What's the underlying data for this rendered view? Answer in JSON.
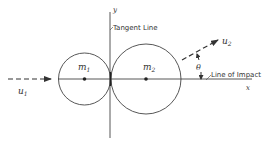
{
  "diagram": {
    "axes": {
      "x_label": "x",
      "y_label": "y"
    },
    "bodies": [
      {
        "label": "m",
        "subscript": "1",
        "name": "mass-1"
      },
      {
        "label": "m",
        "subscript": "2",
        "name": "mass-2"
      }
    ],
    "velocities": [
      {
        "label": "u",
        "subscript": "1",
        "name": "initial-velocity-1"
      },
      {
        "label": "u",
        "subscript": "2",
        "name": "velocity-2"
      }
    ],
    "angle_label": "θ",
    "annotations": {
      "tangent_line": "Tangent Line",
      "line_of_impact": "Line of Impact"
    },
    "colors": {
      "stroke": "#333333",
      "background": "#ffffff"
    }
  }
}
